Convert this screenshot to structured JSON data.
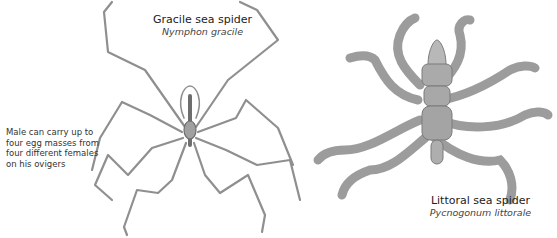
{
  "gracile": {
    "common_name": "Gracile sea spider",
    "scientific_name": "Nymphon gracile",
    "note": "Male can carry up to four egg masses from four different females on his ovigers"
  },
  "littoral": {
    "common_name": "Littoral sea spider",
    "scientific_name": "Pycnogonum littorale"
  },
  "colors": {
    "background": "#ffffff",
    "illustration_gray": "#8a8a8a",
    "text": "#222222"
  }
}
